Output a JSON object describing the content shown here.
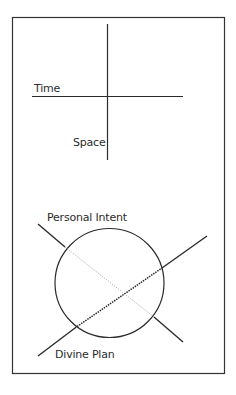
{
  "diagram": {
    "top": {
      "horizontal_axis_label": "Time",
      "vertical_axis_label": "Space"
    },
    "bottom": {
      "upper_line_label": "Personal Intent",
      "lower_line_label": "Divine Plan",
      "shape": "circle with two crossing lines"
    }
  },
  "colors": {
    "stroke": "#2b2b2b",
    "background": "#ffffff"
  }
}
